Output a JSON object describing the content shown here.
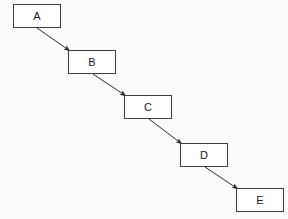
{
  "diagram": {
    "background_color": "#fbfbfa",
    "node_fill_color": "#ffffff",
    "node_border_color": "#3d3d3d",
    "edge_color": "#2b2b2b",
    "label_color": "#1a1a1a",
    "nodes": [
      {
        "id": "A",
        "label": "A",
        "x": 13,
        "y": 4,
        "width": 48,
        "height": 24
      },
      {
        "id": "B",
        "label": "B",
        "x": 68,
        "y": 50,
        "width": 48,
        "height": 24
      },
      {
        "id": "C",
        "label": "C",
        "x": 124,
        "y": 95,
        "width": 48,
        "height": 24
      },
      {
        "id": "D",
        "label": "D",
        "x": 180,
        "y": 143,
        "width": 48,
        "height": 24
      },
      {
        "id": "E",
        "label": "E",
        "x": 236,
        "y": 188,
        "width": 48,
        "height": 24
      }
    ],
    "edges": [
      {
        "id": "A-B",
        "from": "A",
        "to": "B",
        "x1": 37,
        "y1": 28,
        "x2": 70,
        "y2": 51
      },
      {
        "id": "B-C",
        "from": "B",
        "to": "C",
        "x1": 93,
        "y1": 74,
        "x2": 126,
        "y2": 96
      },
      {
        "id": "C-D",
        "from": "C",
        "to": "D",
        "x1": 149,
        "y1": 119,
        "x2": 182,
        "y2": 144
      },
      {
        "id": "D-E",
        "from": "D",
        "to": "E",
        "x1": 205,
        "y1": 167,
        "x2": 238,
        "y2": 189
      }
    ]
  }
}
